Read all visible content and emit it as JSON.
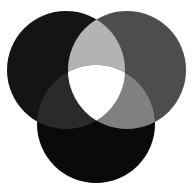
{
  "figure": {
    "background_color": "#ffffff",
    "width": 193,
    "height": 188
  },
  "chart_data": {
    "type": "venn",
    "subtitle": "",
    "xlabel": "",
    "ylabel": "",
    "legend_position": "none",
    "grid": false,
    "set_count": 3,
    "sets": [
      {
        "id": "left",
        "name": "Set A",
        "label": "",
        "color": "#141414",
        "cx": 66,
        "cy": 70,
        "r": 59
      },
      {
        "id": "right",
        "name": "Set B",
        "label": "",
        "color": "#4d4d4d",
        "cx": 127,
        "cy": 70,
        "r": 59
      },
      {
        "id": "bottom",
        "name": "Set C",
        "label": "",
        "color": "#0a0a0a",
        "cx": 96,
        "cy": 124,
        "r": 59
      }
    ],
    "regions": [
      {
        "id": "left-only",
        "sets": [
          "left"
        ],
        "color": "#141414"
      },
      {
        "id": "right-only",
        "sets": [
          "right"
        ],
        "color": "#4d4d4d"
      },
      {
        "id": "bottom-only",
        "sets": [
          "bottom"
        ],
        "color": "#0a0a0a"
      },
      {
        "id": "left-right",
        "sets": [
          "left",
          "right"
        ],
        "color": "#b3b3b3"
      },
      {
        "id": "left-bottom",
        "sets": [
          "left",
          "bottom"
        ],
        "color": "#2a2a2a"
      },
      {
        "id": "right-bottom",
        "sets": [
          "right",
          "bottom"
        ],
        "color": "#808080"
      },
      {
        "id": "all-three",
        "sets": [
          "left",
          "right",
          "bottom"
        ],
        "color": "#ffffff"
      }
    ]
  }
}
